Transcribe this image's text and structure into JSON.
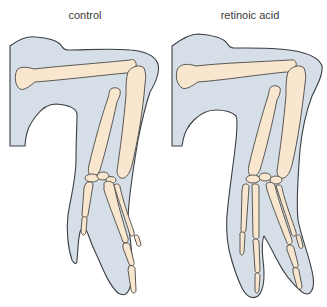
{
  "figure": {
    "panels": [
      {
        "id": "control",
        "label": "control",
        "digits": 2
      },
      {
        "id": "retinoic-acid",
        "label": "retinoic acid",
        "digits": 4
      }
    ],
    "colors": {
      "background": "#ffffff",
      "skin_fill": "#d6dfe8",
      "bone_fill": "#f8e6cf",
      "outline": "#3b3f44",
      "label_text": "#3a3a3a"
    }
  }
}
